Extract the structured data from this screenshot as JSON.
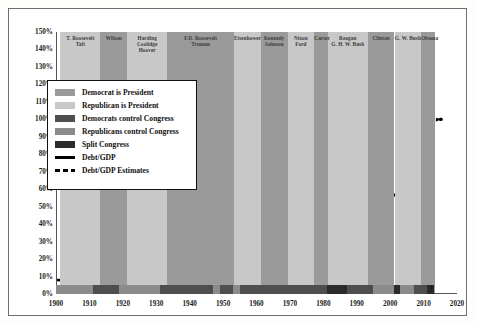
{
  "chart_data": {
    "type": "line",
    "xlabel": "",
    "ylabel": "",
    "xlim": [
      1900,
      2020
    ],
    "ylim": [
      0,
      150
    ],
    "grid": false,
    "legend_position": "upper-left-inside",
    "y_ticks": [
      "0%",
      "10%",
      "20%",
      "30%",
      "40%",
      "50%",
      "60%",
      "70%",
      "80%",
      "90%",
      "100%",
      "110%",
      "120%",
      "130%",
      "140%",
      "150%"
    ],
    "y_tick_values": [
      0,
      10,
      20,
      30,
      40,
      50,
      60,
      70,
      80,
      90,
      100,
      110,
      120,
      130,
      140,
      150
    ],
    "x_ticks": [
      "1900",
      "1910",
      "1920",
      "1930",
      "1940",
      "1950",
      "1960",
      "1970",
      "1980",
      "1990",
      "2000",
      "2010",
      "2020"
    ],
    "x_tick_values": [
      1900,
      1910,
      1920,
      1930,
      1940,
      1950,
      1960,
      1970,
      1980,
      1990,
      2000,
      2010,
      2020
    ],
    "series": [
      {
        "name": "Debt/GDP",
        "style": "solid",
        "color": "#000000",
        "x": [
          1900,
          1902,
          1904,
          1906,
          1908,
          1910,
          1912,
          1914,
          1916,
          1917,
          1918,
          1919,
          1920,
          1921,
          1922,
          1923,
          1924,
          1925,
          1926,
          1927,
          1928,
          1929,
          1930,
          1931,
          1932,
          1933,
          1934,
          1935,
          1936,
          1937,
          1938,
          1939,
          1940,
          1941,
          1942,
          1943,
          1944,
          1945,
          1946,
          1947,
          1948,
          1949,
          1950,
          1951,
          1952,
          1953,
          1954,
          1955,
          1956,
          1957,
          1958,
          1959,
          1960,
          1961,
          1962,
          1963,
          1964,
          1965,
          1966,
          1967,
          1968,
          1969,
          1970,
          1971,
          1972,
          1973,
          1974,
          1975,
          1976,
          1977,
          1978,
          1979,
          1980,
          1981,
          1982,
          1983,
          1984,
          1985,
          1986,
          1987,
          1988,
          1989,
          1990,
          1991,
          1992,
          1993,
          1994,
          1995,
          1996,
          1997,
          1998,
          1999,
          2000,
          2001,
          2002,
          2003,
          2004,
          2005,
          2006,
          2007,
          2008,
          2009,
          2010
        ],
        "y": [
          8.0,
          7.8,
          7.6,
          7.4,
          8.2,
          8.0,
          7.6,
          7.5,
          7.8,
          12.0,
          25.0,
          33.0,
          30.0,
          27.0,
          28.5,
          25.0,
          23.0,
          22.0,
          21.0,
          20.0,
          19.0,
          18.0,
          18.5,
          22.0,
          33.0,
          40.0,
          42.5,
          40.0,
          41.0,
          40.0,
          43.0,
          44.0,
          43.0,
          45.0,
          60.0,
          85.0,
          105.0,
          118.0,
          121.0,
          109.0,
          98.0,
          93.0,
          94.0,
          80.0,
          74.0,
          72.0,
          71.0,
          69.5,
          63.0,
          60.0,
          60.0,
          58.0,
          56.0,
          55.0,
          53.5,
          51.5,
          49.0,
          46.5,
          43.5,
          42.0,
          42.0,
          38.5,
          37.5,
          37.5,
          37.0,
          35.5,
          33.5,
          34.5,
          36.0,
          35.5,
          35.0,
          33.0,
          33.0,
          32.5,
          35.0,
          39.5,
          41.0,
          43.5,
          47.5,
          49.5,
          51.5,
          52.5,
          55.0,
          59.5,
          62.5,
          65.0,
          66.0,
          67.0,
          67.0,
          65.0,
          63.0,
          60.5,
          57.0,
          56.5,
          58.5,
          61.0,
          62.5,
          63.0,
          63.5,
          64.0,
          69.5,
          84.0,
          92.0
        ]
      },
      {
        "name": "Debt/GDP Estimates",
        "style": "dashed",
        "color": "#000000",
        "x": [
          2010,
          2011,
          2012,
          2013,
          2014,
          2015
        ],
        "y": [
          92.0,
          96.0,
          98.0,
          99.5,
          100.0,
          100.0
        ]
      }
    ],
    "annotations": [
      {
        "text": "?",
        "x": 2012,
        "y": 1,
        "note": "uncertainty marker on congress-control strip"
      }
    ]
  },
  "legend": {
    "items": [
      {
        "label": "Democrat is President",
        "type": "swatch",
        "color": "#9a9a9a"
      },
      {
        "label": "Republican is President",
        "type": "swatch",
        "color": "#c8c8c8"
      },
      {
        "label": "Democrats control Congress",
        "type": "swatch",
        "color": "#4e4e4e"
      },
      {
        "label": "Republicans control Congress",
        "type": "swatch",
        "color": "#8b8b8b"
      },
      {
        "label": "Split Congress",
        "type": "swatch",
        "color": "#2b2b2b"
      },
      {
        "label": "Debt/GDP",
        "type": "line",
        "color": "#000000"
      },
      {
        "label": "Debt/GDP Estimates",
        "type": "dashed-line",
        "color": "#000000"
      }
    ]
  },
  "president_bands": [
    {
      "label": "T. Roosevelt\nTaft",
      "start": 1901,
      "end": 1913,
      "party": "Republican",
      "color": "#c8c8c8"
    },
    {
      "label": "Wilson",
      "start": 1913,
      "end": 1921,
      "party": "Democrat",
      "color": "#9a9a9a"
    },
    {
      "label": "Harding\nCoolidge\nHoover",
      "start": 1921,
      "end": 1933,
      "party": "Republican",
      "color": "#c8c8c8"
    },
    {
      "label": "F.D. Roosevelt\nTruman",
      "start": 1933,
      "end": 1953,
      "party": "Democrat",
      "color": "#9a9a9a"
    },
    {
      "label": "Eisenhower",
      "start": 1953,
      "end": 1961,
      "party": "Republican",
      "color": "#c8c8c8"
    },
    {
      "label": "Kennedy\nJohnson",
      "start": 1961,
      "end": 1969,
      "party": "Democrat",
      "color": "#9a9a9a"
    },
    {
      "label": "Nixon\nFord",
      "start": 1969,
      "end": 1977,
      "party": "Republican",
      "color": "#c8c8c8"
    },
    {
      "label": "Carter",
      "start": 1977,
      "end": 1981,
      "party": "Democrat",
      "color": "#9a9a9a"
    },
    {
      "label": "Reagan\nG. H. W. Bush",
      "start": 1981,
      "end": 1993,
      "party": "Republican",
      "color": "#c8c8c8"
    },
    {
      "label": "Clinton",
      "start": 1993,
      "end": 2001,
      "party": "Democrat",
      "color": "#9a9a9a"
    },
    {
      "label": "G. W. Bush",
      "start": 2001,
      "end": 2009,
      "party": "Republican",
      "color": "#c8c8c8"
    },
    {
      "label": "Obama",
      "start": 2009,
      "end": 2013,
      "party": "Democrat",
      "color": "#9a9a9a"
    }
  ],
  "congress_bands": [
    {
      "start": 1900,
      "end": 1911,
      "control": "Republicans control Congress",
      "color": "#8b8b8b"
    },
    {
      "start": 1911,
      "end": 1919,
      "control": "Democrats control Congress",
      "color": "#4e4e4e"
    },
    {
      "start": 1919,
      "end": 1931,
      "control": "Republicans control Congress",
      "color": "#8b8b8b"
    },
    {
      "start": 1931,
      "end": 1947,
      "control": "Democrats control Congress",
      "color": "#4e4e4e"
    },
    {
      "start": 1947,
      "end": 1949,
      "control": "Republicans control Congress",
      "color": "#8b8b8b"
    },
    {
      "start": 1949,
      "end": 1953,
      "control": "Democrats control Congress",
      "color": "#4e4e4e"
    },
    {
      "start": 1953,
      "end": 1955,
      "control": "Republicans control Congress",
      "color": "#8b8b8b"
    },
    {
      "start": 1955,
      "end": 1981,
      "control": "Democrats control Congress",
      "color": "#4e4e4e"
    },
    {
      "start": 1981,
      "end": 1987,
      "control": "Split Congress",
      "color": "#2b2b2b"
    },
    {
      "start": 1987,
      "end": 1995,
      "control": "Democrats control Congress",
      "color": "#4e4e4e"
    },
    {
      "start": 1995,
      "end": 2001,
      "control": "Republicans control Congress",
      "color": "#8b8b8b"
    },
    {
      "start": 2001,
      "end": 2003,
      "control": "Split Congress",
      "color": "#2b2b2b"
    },
    {
      "start": 2003,
      "end": 2007,
      "control": "Republicans control Congress",
      "color": "#8b8b8b"
    },
    {
      "start": 2007,
      "end": 2011,
      "control": "Democrats control Congress",
      "color": "#4e4e4e"
    },
    {
      "start": 2011,
      "end": 2013,
      "control": "Split Congress",
      "color": "#2b2b2b"
    }
  ],
  "uncertainty_marker": "?"
}
